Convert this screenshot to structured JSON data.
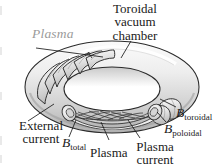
{
  "figure": {
    "title_label": "Toroidal\nvacuum\nchamber",
    "title_line1": "Toroidal",
    "title_line2": "vacuum",
    "title_line3": "chamber",
    "background_color": "#ffffff",
    "line_color": "#1a1a1a",
    "torus_fill_light": "#f2f2f2",
    "torus_fill_mid": "#d8d8d8",
    "torus_fill_dark": "#b4b4b4",
    "plasma_label_color": "#9a9a9a"
  },
  "labels": {
    "plasma_top": "Plasma",
    "external_current_line1": "External",
    "external_current_line2": "current",
    "b_total_symbol": "B",
    "b_total_subscript": "total",
    "plasma_bottom": "Plasma",
    "plasma_current_line1": "Plasma",
    "plasma_current_line2": "current",
    "b_poloidal_symbol": "B",
    "b_poloidal_subscript": "poloidal",
    "b_toroidal_symbol": "B",
    "b_toroidal_subscript": "toroidal"
  }
}
